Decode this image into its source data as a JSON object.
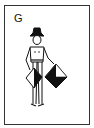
{
  "card": {
    "letter": "G",
    "subject": "semaphore-signaler",
    "flag_colors": {
      "dark": "#111111",
      "light": "#ffffff"
    },
    "border_color": "#333333"
  }
}
